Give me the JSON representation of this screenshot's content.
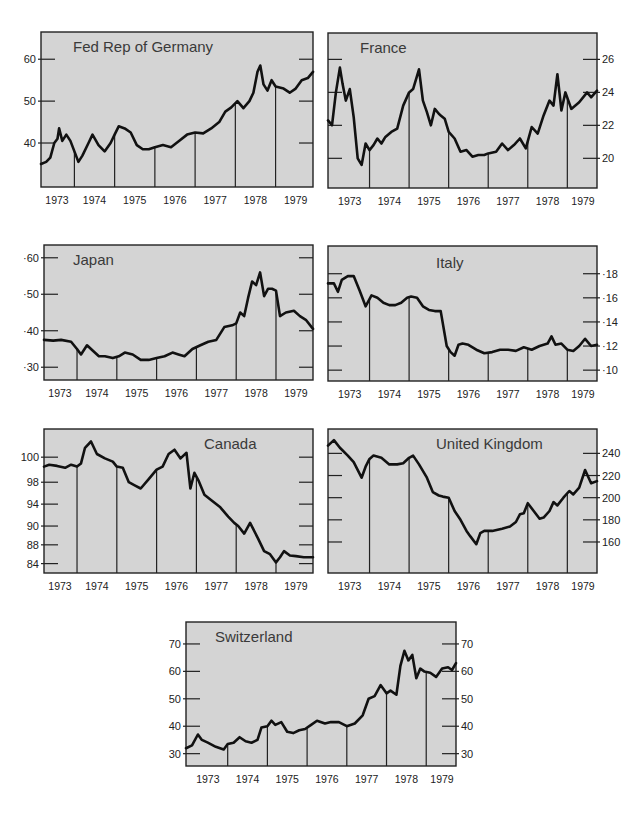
{
  "figure": {
    "background": "#ffffff",
    "plot_background": "#d4d4d4",
    "line_color": "#111111"
  },
  "chart_data": [
    {
      "id": "germany",
      "type": "line",
      "title": "Fed Rep of Germany",
      "box": {
        "x": 41,
        "y": 32,
        "w": 272,
        "h": 155
      },
      "title_pos": {
        "x": 32,
        "y": 20
      },
      "x_range": [
        1973.17,
        1979.93
      ],
      "ylim": [
        29.5,
        66.5
      ],
      "y_axis_side": "left",
      "y_ticks": [
        {
          "v": 40,
          "label": "40"
        },
        {
          "v": 50,
          "label": "50"
        },
        {
          "v": 60,
          "label": "60"
        }
      ],
      "right_ticks": [
        40,
        50,
        60
      ],
      "year_lines": [
        1974,
        1975,
        1976,
        1977,
        1978,
        1979
      ],
      "x_labels": [
        "1973",
        "1974",
        "1975",
        "1976",
        "1977",
        "1978",
        "1979"
      ],
      "x": [
        1973.17,
        1973.3,
        1973.4,
        1973.5,
        1973.58,
        1973.62,
        1973.7,
        1973.8,
        1973.9,
        1974.0,
        1974.1,
        1974.2,
        1974.35,
        1974.45,
        1974.6,
        1974.75,
        1974.9,
        1975.0,
        1975.1,
        1975.25,
        1975.4,
        1975.55,
        1975.7,
        1975.85,
        1976.0,
        1976.2,
        1976.4,
        1976.6,
        1976.8,
        1977.0,
        1977.2,
        1977.4,
        1977.6,
        1977.75,
        1977.9,
        1978.05,
        1978.2,
        1978.35,
        1978.45,
        1978.55,
        1978.62,
        1978.7,
        1978.8,
        1978.9,
        1979.0,
        1979.2,
        1979.35,
        1979.5,
        1979.65,
        1979.8,
        1979.93
      ],
      "values": [
        35,
        35.5,
        36.5,
        40,
        41,
        43.5,
        40.5,
        42,
        40.5,
        38,
        35.5,
        37,
        40,
        42,
        39.5,
        38,
        40,
        42,
        44,
        43.5,
        42.5,
        39.5,
        38.5,
        38.5,
        39,
        39.5,
        39,
        40.5,
        42,
        42.5,
        42.3,
        43.5,
        45,
        47.5,
        48.5,
        50,
        48.3,
        50,
        52,
        57,
        58.5,
        54,
        52.5,
        55,
        53.5,
        53,
        52,
        53,
        55,
        55.5,
        57
      ]
    },
    {
      "id": "france",
      "type": "line",
      "title": "France",
      "box": {
        "x": 328,
        "y": 33,
        "w": 269,
        "h": 155
      },
      "title_pos": {
        "x": 32,
        "y": 20
      },
      "x_range": [
        1972.95,
        1979.75
      ],
      "ylim": [
        18.2,
        27.6
      ],
      "y_axis_side": "right",
      "y_ticks": [
        {
          "v": 20,
          "label": "20"
        },
        {
          "v": 22,
          "label": "22"
        },
        {
          "v": 24,
          "label": "24"
        },
        {
          "v": 26,
          "label": "26"
        }
      ],
      "left_ticks": [
        20,
        22,
        24,
        26
      ],
      "year_lines": [
        1974,
        1975,
        1976,
        1977,
        1978,
        1979
      ],
      "x_labels": [
        "1973",
        "1974",
        "1975",
        "1976",
        "1977",
        "1978",
        "1979"
      ],
      "x": [
        1972.95,
        1973.05,
        1973.15,
        1973.25,
        1973.32,
        1973.4,
        1973.5,
        1973.6,
        1973.7,
        1973.8,
        1973.9,
        1974.0,
        1974.1,
        1974.2,
        1974.3,
        1974.4,
        1974.55,
        1974.7,
        1974.85,
        1975.0,
        1975.1,
        1975.25,
        1975.35,
        1975.45,
        1975.55,
        1975.65,
        1975.75,
        1975.8,
        1975.9,
        1976.0,
        1976.15,
        1976.3,
        1976.45,
        1976.6,
        1976.75,
        1976.9,
        1977.0,
        1977.2,
        1977.35,
        1977.5,
        1977.65,
        1977.8,
        1977.95,
        1978.1,
        1978.25,
        1978.4,
        1978.55,
        1978.65,
        1978.75,
        1978.85,
        1978.95,
        1979.1,
        1979.3,
        1979.5,
        1979.6,
        1979.75
      ],
      "values": [
        22.3,
        22,
        24,
        25.5,
        24.5,
        23.5,
        24.2,
        22.5,
        20,
        19.6,
        20.9,
        20.5,
        20.8,
        21.2,
        20.9,
        21.3,
        21.6,
        21.8,
        23.2,
        24,
        24.2,
        25.4,
        23.5,
        22.8,
        22,
        23,
        22.7,
        22.6,
        22.4,
        21.6,
        21.2,
        20.4,
        20.5,
        20.1,
        20.2,
        20.2,
        20.3,
        20.4,
        20.9,
        20.5,
        20.8,
        21.2,
        20.6,
        21.9,
        21.5,
        22.6,
        23.5,
        23.2,
        25.1,
        22.9,
        24,
        23,
        23.4,
        24,
        23.7,
        24.1
      ]
    },
    {
      "id": "japan",
      "type": "line",
      "title": "Japan",
      "box": {
        "x": 44,
        "y": 245,
        "w": 269,
        "h": 135
      },
      "title_pos": {
        "x": 29,
        "y": 20
      },
      "x_range": [
        1973.17,
        1979.93
      ],
      "ylim": [
        26.5,
        63.5
      ],
      "y_axis_side": "left",
      "y_ticks": [
        {
          "v": 30,
          "label": "·30"
        },
        {
          "v": 40,
          "label": "·40"
        },
        {
          "v": 50,
          "label": "·50"
        },
        {
          "v": 60,
          "label": "·60"
        }
      ],
      "right_ticks": [
        30,
        40,
        50,
        60
      ],
      "year_lines": [
        1974,
        1975,
        1976,
        1977,
        1978,
        1979
      ],
      "x_labels": [
        "1973",
        "1974",
        "1975",
        "1976",
        "1977",
        "1978",
        "1979"
      ],
      "x": [
        1973.17,
        1973.4,
        1973.6,
        1973.85,
        1974.0,
        1974.1,
        1974.25,
        1974.4,
        1974.55,
        1974.7,
        1974.9,
        1975.05,
        1975.2,
        1975.4,
        1975.6,
        1975.8,
        1976.0,
        1976.2,
        1976.4,
        1976.55,
        1976.7,
        1976.9,
        1977.1,
        1977.3,
        1977.5,
        1977.7,
        1977.9,
        1978.0,
        1978.1,
        1978.2,
        1978.3,
        1978.4,
        1978.5,
        1978.6,
        1978.7,
        1978.8,
        1978.9,
        1979.0,
        1979.1,
        1979.25,
        1979.45,
        1979.6,
        1979.75,
        1979.93
      ],
      "values": [
        37.5,
        37.3,
        37.5,
        37,
        35,
        33.5,
        36,
        34.5,
        33,
        33,
        32.5,
        33,
        34,
        33.5,
        32,
        32,
        32.5,
        33,
        34,
        33.5,
        33,
        35,
        36,
        37,
        37.5,
        41,
        41.5,
        42,
        45,
        44,
        49,
        53.5,
        52.5,
        56,
        49.5,
        51.5,
        51.5,
        51,
        44,
        45,
        45.5,
        44,
        43,
        40.5
      ]
    },
    {
      "id": "italy",
      "type": "line",
      "title": "Italy",
      "box": {
        "x": 328,
        "y": 246,
        "w": 269,
        "h": 135
      },
      "title_pos": {
        "x": 108,
        "y": 22
      },
      "x_range": [
        1972.95,
        1979.75
      ],
      "ylim": [
        9.1,
        20.3
      ],
      "y_axis_side": "right",
      "y_ticks": [
        {
          "v": 10,
          "label": "·10"
        },
        {
          "v": 12,
          "label": "·12"
        },
        {
          "v": 14,
          "label": "·14"
        },
        {
          "v": 16,
          "label": "·16"
        },
        {
          "v": 18,
          "label": "·18"
        }
      ],
      "left_ticks": [
        10,
        12,
        14,
        16,
        18
      ],
      "year_lines": [
        1974,
        1975,
        1976,
        1977,
        1978,
        1979
      ],
      "x_labels": [
        "1973",
        "1974",
        "1975",
        "1976",
        "1977",
        "1978",
        "1979"
      ],
      "x": [
        1972.95,
        1973.1,
        1973.2,
        1973.3,
        1973.45,
        1973.6,
        1973.75,
        1973.9,
        1974.05,
        1974.2,
        1974.35,
        1974.5,
        1974.65,
        1974.8,
        1974.95,
        1975.05,
        1975.2,
        1975.35,
        1975.5,
        1975.65,
        1975.8,
        1975.95,
        1976.05,
        1976.15,
        1976.25,
        1976.35,
        1976.5,
        1976.7,
        1976.9,
        1977.1,
        1977.3,
        1977.5,
        1977.7,
        1977.9,
        1978.1,
        1978.3,
        1978.5,
        1978.6,
        1978.7,
        1978.85,
        1979.0,
        1979.15,
        1979.3,
        1979.45,
        1979.6,
        1979.75
      ],
      "values": [
        17.2,
        17.2,
        16.5,
        17.5,
        17.8,
        17.8,
        16.6,
        15.3,
        16.2,
        16,
        15.6,
        15.4,
        15.4,
        15.6,
        16,
        16.1,
        16,
        15.3,
        15,
        14.9,
        14.9,
        12,
        11.5,
        11.2,
        12.1,
        12.2,
        12.1,
        11.7,
        11.4,
        11.5,
        11.7,
        11.7,
        11.6,
        11.9,
        11.7,
        12,
        12.2,
        12.8,
        12.1,
        12.2,
        11.7,
        11.6,
        12,
        12.6,
        12,
        12.1
      ]
    },
    {
      "id": "canada",
      "type": "line",
      "title": "Canada",
      "box": {
        "x": 44,
        "y": 429,
        "w": 269,
        "h": 144
      },
      "title_pos": {
        "x": 160,
        "y": 20
      },
      "x_range": [
        1973.17,
        1979.93
      ],
      "ylim": [
        81.5,
        104.5
      ],
      "y_axis_side": "left",
      "y_tick_note": "tick labels as printed: 100, 98, 94, 90, 88, 84 at evenly spaced positions",
      "y_ticks": [
        {
          "v": 100,
          "label": "100"
        },
        {
          "v": 96,
          "label": "98"
        },
        {
          "v": 92.5,
          "label": "94"
        },
        {
          "v": 89,
          "label": "90"
        },
        {
          "v": 86,
          "label": "88"
        },
        {
          "v": 83,
          "label": "84"
        }
      ],
      "right_ticks": [
        100,
        96,
        92.5,
        89,
        86,
        83
      ],
      "year_lines": [
        1974,
        1975,
        1976,
        1977,
        1978,
        1979
      ],
      "x_labels": [
        "1973",
        "1974",
        "1975",
        "1976",
        "1977",
        "1978",
        "1979"
      ],
      "x": [
        1973.17,
        1973.3,
        1973.5,
        1973.7,
        1973.85,
        1974.0,
        1974.1,
        1974.2,
        1974.35,
        1974.5,
        1974.7,
        1974.9,
        1975.0,
        1975.15,
        1975.3,
        1975.45,
        1975.6,
        1975.8,
        1976.0,
        1976.15,
        1976.3,
        1976.45,
        1976.6,
        1976.75,
        1976.85,
        1976.95,
        1977.05,
        1977.2,
        1977.4,
        1977.6,
        1977.8,
        1977.95,
        1978.05,
        1978.2,
        1978.35,
        1978.55,
        1978.7,
        1978.85,
        1979.0,
        1979.1,
        1979.2,
        1979.35,
        1979.5,
        1979.7,
        1979.93
      ],
      "values": [
        98.5,
        98.8,
        98.6,
        98.3,
        98.8,
        98.5,
        99,
        101.5,
        102.5,
        100.5,
        99.8,
        99.3,
        98.5,
        98.3,
        96,
        95.5,
        95,
        96.5,
        98,
        98.5,
        100.5,
        101.2,
        99.8,
        100.7,
        95,
        97.5,
        96.3,
        94,
        93,
        92,
        90.5,
        89.5,
        89,
        87.8,
        89.5,
        87,
        85,
        84.5,
        83.2,
        84,
        85,
        84.3,
        84.2,
        84,
        84
      ]
    },
    {
      "id": "united_kingdom",
      "type": "line",
      "title": "United Kingdom",
      "box": {
        "x": 328,
        "y": 429,
        "w": 269,
        "h": 144
      },
      "title_pos": {
        "x": 108,
        "y": 20
      },
      "x_range": [
        1972.95,
        1979.75
      ],
      "ylim": [
        132,
        262
      ],
      "y_axis_side": "right",
      "y_ticks": [
        {
          "v": 160,
          "label": "160"
        },
        {
          "v": 180,
          "label": "180"
        },
        {
          "v": 200,
          "label": "200"
        },
        {
          "v": 220,
          "label": "220"
        },
        {
          "v": 240,
          "label": "240"
        }
      ],
      "left_ticks": [
        160,
        180,
        200,
        220,
        240
      ],
      "year_lines": [
        1974,
        1975,
        1976,
        1977,
        1978,
        1979
      ],
      "x_labels": [
        "1973",
        "1974",
        "1975",
        "1976",
        "1977",
        "1978",
        "1979"
      ],
      "x": [
        1972.95,
        1973.1,
        1973.25,
        1973.45,
        1973.6,
        1973.8,
        1973.9,
        1974.0,
        1974.1,
        1974.3,
        1974.5,
        1974.7,
        1974.85,
        1975.0,
        1975.1,
        1975.25,
        1975.45,
        1975.6,
        1975.75,
        1975.85,
        1976.0,
        1976.15,
        1976.3,
        1976.45,
        1976.55,
        1976.7,
        1976.8,
        1976.9,
        1977.1,
        1977.35,
        1977.55,
        1977.7,
        1977.8,
        1977.9,
        1978.0,
        1978.15,
        1978.3,
        1978.4,
        1978.55,
        1978.65,
        1978.75,
        1978.9,
        1979.05,
        1979.15,
        1979.3,
        1979.45,
        1979.6,
        1979.75
      ],
      "values": [
        247,
        252,
        245,
        238,
        232,
        218,
        228,
        235,
        238,
        236,
        230,
        230,
        231,
        236,
        238,
        230,
        218,
        205,
        202,
        201,
        200,
        188,
        180,
        170,
        165,
        158,
        168,
        170,
        170,
        172,
        174,
        178,
        185,
        186,
        195,
        188,
        181,
        182,
        188,
        196,
        193,
        200,
        206,
        203,
        209,
        225,
        213,
        215
      ]
    },
    {
      "id": "switzerland",
      "type": "line",
      "title": "Switzerland",
      "box": {
        "x": 186,
        "y": 622,
        "w": 270,
        "h": 144
      },
      "title_pos": {
        "x": 29,
        "y": 20
      },
      "x_range": [
        1972.95,
        1979.75
      ],
      "ylim": [
        25.5,
        78
      ],
      "y_axis_side": "both",
      "y_ticks": [
        {
          "v": 30,
          "label": "30"
        },
        {
          "v": 40,
          "label": "40"
        },
        {
          "v": 50,
          "label": "50"
        },
        {
          "v": 60,
          "label": "60"
        },
        {
          "v": 70,
          "label": "70"
        }
      ],
      "year_lines": [
        1974,
        1975,
        1976,
        1977,
        1978,
        1979
      ],
      "x_labels": [
        "1973",
        "1974",
        "1975",
        "1976",
        "1977",
        "1978",
        "1979"
      ],
      "x": [
        1972.95,
        1973.1,
        1973.25,
        1973.35,
        1973.5,
        1973.7,
        1973.9,
        1974.0,
        1974.15,
        1974.3,
        1974.45,
        1974.6,
        1974.75,
        1974.85,
        1975.0,
        1975.1,
        1975.2,
        1975.35,
        1975.5,
        1975.65,
        1975.8,
        1975.95,
        1976.1,
        1976.25,
        1976.45,
        1976.6,
        1976.8,
        1977.0,
        1977.2,
        1977.4,
        1977.55,
        1977.7,
        1977.85,
        1978.0,
        1978.1,
        1978.25,
        1978.35,
        1978.45,
        1978.55,
        1978.65,
        1978.75,
        1978.85,
        1978.95,
        1979.1,
        1979.25,
        1979.4,
        1979.55,
        1979.65,
        1979.75
      ],
      "values": [
        32,
        33,
        37,
        35,
        34,
        32.5,
        31.5,
        33.5,
        34,
        36,
        34.5,
        34,
        35,
        39.5,
        40,
        42,
        40.5,
        41.5,
        38,
        37.5,
        38.5,
        39,
        40.5,
        42,
        41,
        41.5,
        41.5,
        40,
        41,
        44,
        50,
        51,
        55,
        52,
        53,
        51.5,
        62,
        67.5,
        64,
        66,
        57.5,
        61,
        60,
        59.5,
        58,
        61,
        61.5,
        60.5,
        63
      ]
    }
  ]
}
